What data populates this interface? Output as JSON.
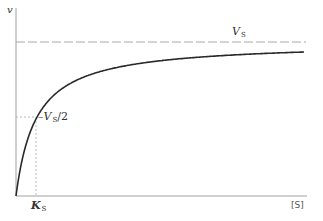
{
  "chart_data": {
    "type": "line",
    "title": "",
    "xlabel": "[S]",
    "ylabel": "v",
    "function": "v = Vs*[S]/(Ks+[S])",
    "series": [
      {
        "name": "v",
        "x_rel_Ks": [
          0,
          0.25,
          0.5,
          1,
          2,
          3,
          5,
          8,
          10,
          14.5
        ],
        "y_rel_Vs": [
          0,
          0.2,
          0.333,
          0.5,
          0.667,
          0.75,
          0.833,
          0.889,
          0.909,
          0.935
        ]
      }
    ],
    "reference_lines": [
      {
        "type": "horizontal",
        "label": "V_S",
        "y_rel_Vs": 1.0,
        "style": "dashed"
      },
      {
        "type": "horizontal",
        "label": "V_S/2",
        "y_rel_Vs": 0.5,
        "style": "dotted",
        "from_axis_to_curve": true
      },
      {
        "type": "vertical",
        "label": "K_S",
        "x_rel_Ks": 1,
        "style": "dotted",
        "from_axis_to_curve": true
      }
    ],
    "annotations": [
      "V_S",
      "V_S/2",
      "K_S"
    ],
    "grid": false,
    "legend": null
  },
  "labels": {
    "y_axis": "v",
    "x_axis": "[S]",
    "vs_main": "V",
    "vs_sub": "S",
    "vs_half_prefix": "–V",
    "vs_half_sub": "S",
    "vs_half_suffix": "/2",
    "ks_main": "K",
    "ks_sub": "S"
  },
  "colors": {
    "axis": "#999999",
    "curve": "#2a2a2a",
    "dashed": "#9a9a9a",
    "text": "#333333"
  }
}
